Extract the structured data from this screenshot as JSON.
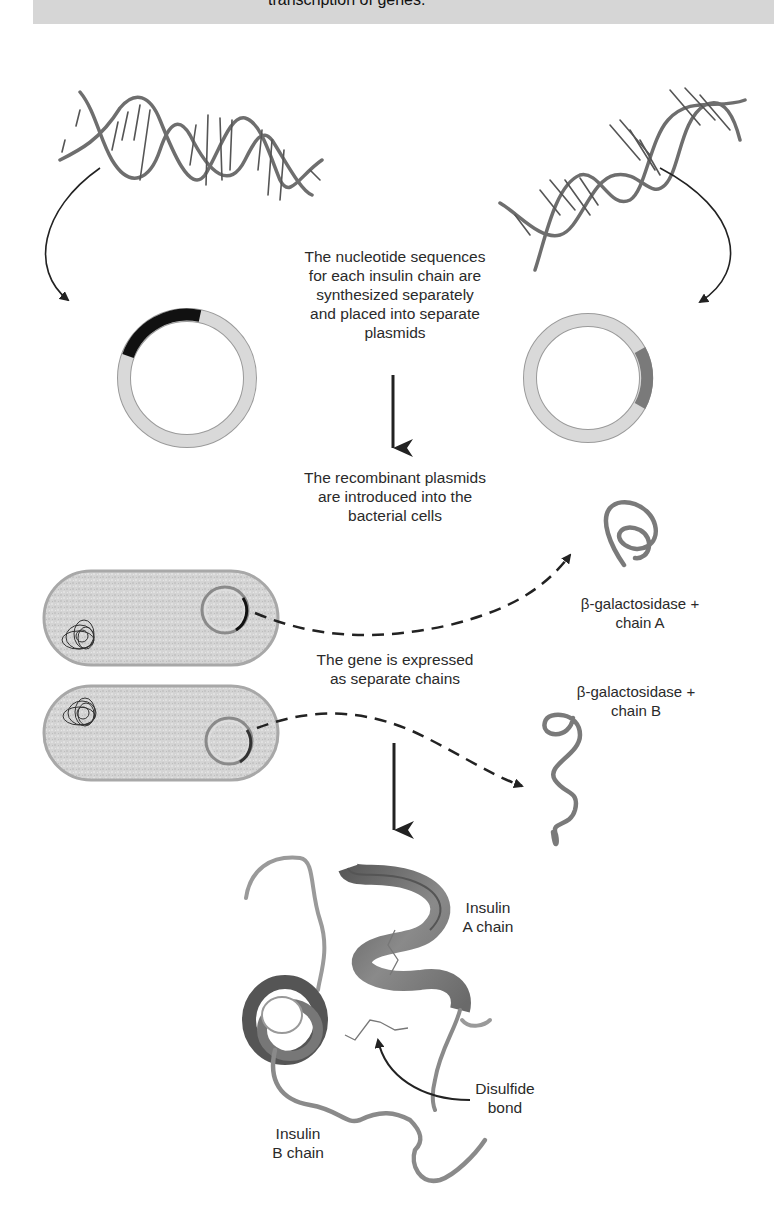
{
  "banner": {
    "text": "transcription of genes.",
    "background": "#d6d6d6"
  },
  "steps": {
    "synthesis": {
      "lines": [
        "The nucleotide sequences",
        "for each insulin chain are",
        "synthesized separately",
        "and placed into separate",
        "plasmids"
      ]
    },
    "introduction": {
      "lines": [
        "The recombinant plasmids",
        "are introduced into the",
        "bacterial cells"
      ]
    },
    "expression": {
      "lines": [
        "The gene is expressed",
        "as separate chains"
      ]
    }
  },
  "products": {
    "chain_a": {
      "lines": [
        "β-galactosidase +",
        "chain A"
      ]
    },
    "chain_b": {
      "lines": [
        "β-galactosidase +",
        "chain B"
      ]
    }
  },
  "insulin": {
    "a_chain": {
      "lines": [
        "Insulin",
        "A chain"
      ]
    },
    "b_chain": {
      "lines": [
        "Insulin",
        "B chain"
      ]
    },
    "disulfide": {
      "lines": [
        "Disulfide",
        "bond"
      ]
    }
  },
  "icons": {
    "dna_left": "dna-double-helix",
    "dna_right": "dna-double-helix",
    "plasmid_left": "plasmid-ring-black-insert",
    "plasmid_right": "plasmid-ring-gray-insert",
    "bacterium_top": "bacterial-cell",
    "bacterium_bottom": "bacterial-cell",
    "protein_a": "coiled-polypeptide",
    "protein_b": "coiled-polypeptide",
    "insulin_structure": "ribbon-protein-model"
  },
  "colors": {
    "strand": "#6e6e6e",
    "plasmid_ring": "#d9d9d9",
    "insert_a": "#111111",
    "insert_b": "#7a7a7a",
    "cell_fill": "#d3d3d3",
    "cell_border": "#a8a8a8",
    "arrow": "#222222"
  }
}
